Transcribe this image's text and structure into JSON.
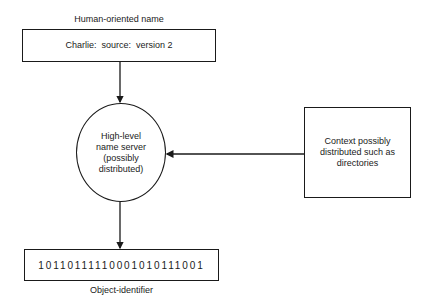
{
  "diagram": {
    "top_label": "Human-oriented name",
    "name_box": {
      "text": "Charlie:  source:  version 2"
    },
    "server_node": {
      "lines": [
        "High-level",
        "name server",
        "(possibly",
        "distributed)"
      ]
    },
    "context_box": {
      "lines": [
        "Context possibly",
        "distributed such as",
        "directories"
      ]
    },
    "identifier_box": {
      "text": "10110111110001010111001"
    },
    "bottom_label": "Object-identifier",
    "edges": [
      {
        "from": "name_box",
        "to": "server_node",
        "direction": "down"
      },
      {
        "from": "context_box",
        "to": "server_node",
        "direction": "left"
      },
      {
        "from": "server_node",
        "to": "identifier_box",
        "direction": "down"
      }
    ],
    "colors": {
      "stroke": "#1a1a1a",
      "background": "#ffffff"
    }
  }
}
